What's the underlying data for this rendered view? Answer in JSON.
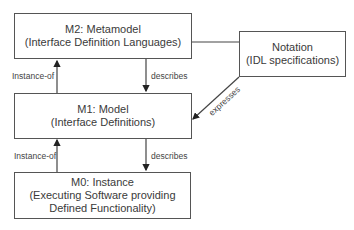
{
  "diagram": {
    "nodes": [
      {
        "id": "m2",
        "title": "M2: Metamodel",
        "subtitle": "(Interface Definition Languages)"
      },
      {
        "id": "m1",
        "title": "M1: Model",
        "subtitle": "(Interface Definitions)"
      },
      {
        "id": "m0",
        "title": "M0: Instance",
        "subtitle": "(Executing Software providing",
        "subtitle2": "Defined Functionality)"
      },
      {
        "id": "notation",
        "title": "Notation",
        "subtitle": "(IDL specifications)"
      }
    ],
    "edges": [
      {
        "from": "m1",
        "to": "m2",
        "label": "Instance-of"
      },
      {
        "from": "m2",
        "to": "m1",
        "label": "describes"
      },
      {
        "from": "m0",
        "to": "m1",
        "label": "Instance-of"
      },
      {
        "from": "m1",
        "to": "m0",
        "label": "describes"
      },
      {
        "from": "notation",
        "to": "m1",
        "label": "expresses"
      },
      {
        "from": "m2",
        "to": "notation",
        "label": ""
      }
    ],
    "colors": {
      "line": "#444444",
      "text": "#3a3a3a",
      "background": "#ffffff"
    }
  }
}
